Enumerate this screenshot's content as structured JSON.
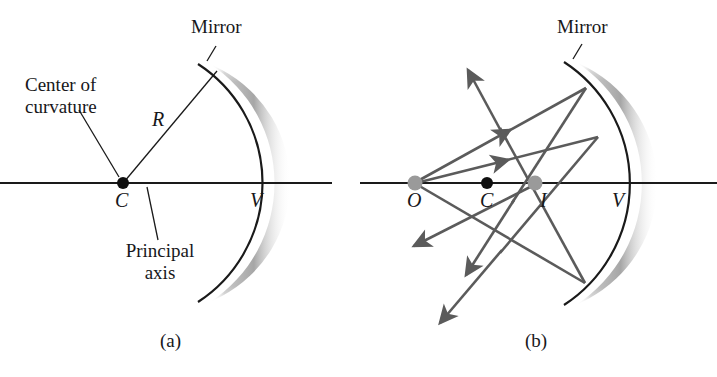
{
  "figure": {
    "type": "optics-ray-diagram",
    "panels": [
      {
        "id": "a",
        "caption": "(a)",
        "labels": {
          "mirror": "Mirror",
          "center_of_curvature": "Center of\ncurvature",
          "center_of_curvature_line1": "Center of",
          "center_of_curvature_line2": "curvature",
          "radius": "R",
          "center_point": "C",
          "vertex_point": "V",
          "principal_axis_line1": "Principal",
          "principal_axis_line2": "axis"
        }
      },
      {
        "id": "b",
        "caption": "(b)",
        "labels": {
          "mirror": "Mirror",
          "object_point": "O",
          "center_point": "C",
          "image_point": "I",
          "vertex_point": "V"
        }
      }
    ]
  },
  "colors": {
    "ink": "#17171a",
    "mirror_line": "#1a1a1a",
    "mirror_shade_dark": "#8e8e8e",
    "mirror_shade_light": "#f2f2f2",
    "ray": "#5b5b5b",
    "axis": "#1a1a1a",
    "point_solid": "#101010",
    "point_gray": "#9a9a9a",
    "background": "#ffffff"
  },
  "geometry": {
    "panel_a": {
      "axis": {
        "x1": 0,
        "x2": 330,
        "y": 183
      },
      "center_of_curvature": {
        "x": 123,
        "y": 183
      },
      "vertex": {
        "x": 262,
        "y": 183
      },
      "mirror_arc": {
        "top": {
          "x": 198,
          "y": 64
        },
        "vertex": {
          "x": 262,
          "y": 183
        },
        "bottom": {
          "x": 198,
          "y": 302
        }
      },
      "radius_line": {
        "from": {
          "x": 123,
          "y": 183
        },
        "to": {
          "x": 216,
          "y": 72
        }
      },
      "leader_center_of_curvature": {
        "from": {
          "x": 78,
          "y": 108
        },
        "to": {
          "x": 119,
          "y": 178
        }
      },
      "leader_principal_axis": {
        "from": {
          "x": 160,
          "y": 240
        },
        "to": {
          "x": 147,
          "y": 186
        }
      },
      "leader_mirror": {
        "from": {
          "x": 215,
          "y": 45
        },
        "to": {
          "x": 206,
          "y": 60
        }
      }
    },
    "panel_b": {
      "axis": {
        "x1": 360,
        "x2": 717,
        "y": 183
      },
      "object": {
        "x": 415,
        "y": 183
      },
      "center_of_curvature": {
        "x": 487,
        "y": 183
      },
      "image": {
        "x": 535,
        "y": 183
      },
      "vertex": {
        "x": 628,
        "y": 183
      },
      "mirror_arc": {
        "top": {
          "x": 564,
          "y": 62
        },
        "vertex": {
          "x": 628,
          "y": 183
        },
        "bottom": {
          "x": 564,
          "y": 305
        }
      },
      "rays": [
        {
          "name": "ray-1-incident",
          "from": {
            "x": 415,
            "y": 183
          },
          "to": {
            "x": 586,
            "y": 88
          }
        },
        {
          "name": "ray-1-reflected",
          "from": {
            "x": 586,
            "y": 88
          },
          "to": {
            "x": 470,
            "y": 268
          }
        },
        {
          "name": "ray-2-incident",
          "from": {
            "x": 415,
            "y": 183
          },
          "to": {
            "x": 598,
            "y": 136
          }
        },
        {
          "name": "ray-2-reflected",
          "from": {
            "x": 598,
            "y": 136
          },
          "to": {
            "x": 443,
            "y": 320
          }
        },
        {
          "name": "ray-3-incident",
          "from": {
            "x": 415,
            "y": 183
          },
          "to": {
            "x": 585,
            "y": 283
          }
        },
        {
          "name": "ray-3-reflected",
          "from": {
            "x": 585,
            "y": 283
          },
          "to": {
            "x": 467,
            "y": 68
          }
        },
        {
          "name": "ray-4-reflected-lower",
          "from": {
            "x": 535,
            "y": 183
          },
          "to": {
            "x": 410,
            "y": 245
          }
        }
      ]
    }
  }
}
